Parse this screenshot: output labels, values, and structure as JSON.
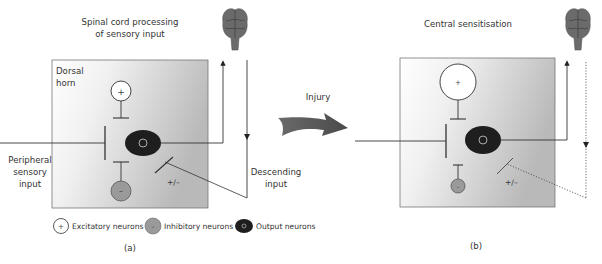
{
  "figure": {
    "panel_a": {
      "title_line1": "Spinal cord processing",
      "title_line2": "of sensory input",
      "region_label_line1": "Dorsal",
      "region_label_line2": "horn",
      "input_label_line1": "Peripheral",
      "input_label_line2": "sensory",
      "input_label_line3": "input",
      "descending_label_line1": "Descending",
      "descending_label_line2": "input",
      "modulation_label": "+/–",
      "caption": "(a)"
    },
    "arrow": {
      "label": "Injury"
    },
    "panel_b": {
      "title": "Central sensitisation",
      "modulation_label": "+/–",
      "caption": "(b)"
    },
    "legend": {
      "items": [
        {
          "symbol": "+",
          "label": "Excitatory neurons"
        },
        {
          "symbol": "–",
          "label": "Inhibitory neurons"
        },
        {
          "symbol": "o",
          "label": "Output neurons"
        }
      ]
    },
    "colors": {
      "box_fill_light": "#ffffff",
      "box_fill_dark": "#bdbdbd",
      "output_neuron": "#1e1e1e",
      "inhibitory_neuron": "#9a9a9a",
      "brain": "#6b6b6b",
      "arrow": "#555555",
      "line": "#333333"
    }
  }
}
